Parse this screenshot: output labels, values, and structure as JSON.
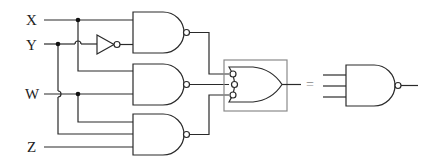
{
  "diagram": {
    "type": "logic-circuit",
    "inputs": [
      {
        "name": "X",
        "label": "X"
      },
      {
        "name": "Y",
        "label": "Y"
      },
      {
        "name": "W",
        "label": "W"
      },
      {
        "name": "Z",
        "label": "Z"
      }
    ],
    "gates": [
      {
        "id": "inv1",
        "type": "NOT",
        "inputs": [
          "Y"
        ]
      },
      {
        "id": "nand1",
        "type": "NAND",
        "inputs": [
          "X",
          "inv1"
        ]
      },
      {
        "id": "nand2",
        "type": "NAND",
        "inputs": [
          "X",
          "W"
        ]
      },
      {
        "id": "nand3",
        "type": "NAND",
        "inputs": [
          "W",
          "Y",
          "Z"
        ]
      },
      {
        "id": "or_neg",
        "type": "OR with inverted inputs (boxed)",
        "inputs": [
          "nand1",
          "nand2",
          "nand3"
        ]
      },
      {
        "id": "nand_eq",
        "type": "NAND (3-input, equivalent)",
        "inputs": [
          "in1",
          "in2",
          "in3"
        ]
      }
    ],
    "equals_sign": "=",
    "colors": {
      "line": "#2a2a2a",
      "box": "#8a8a8a",
      "junction": "#111111"
    }
  }
}
